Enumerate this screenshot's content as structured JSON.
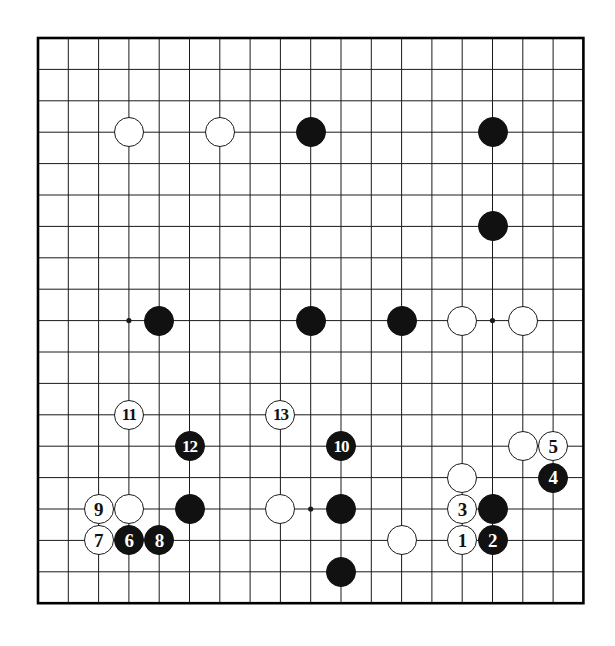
{
  "diagram": {
    "type": "go-board-diagram",
    "board_size": 19,
    "title": "",
    "background_color": "#ffffff",
    "line_color": "#1a1a1a",
    "border_color": "#000000",
    "black_stone_color": "#111111",
    "white_stone_color": "#ffffff",
    "black_label_color": "#ffffff",
    "white_label_color": "#111111"
  },
  "geometry": {
    "origin_x": 38,
    "origin_y": 38,
    "step_x": 30.3,
    "step_y": 31.4,
    "stone_radius": 15,
    "border_width": 2.6,
    "line_width": 1,
    "star_radius": 2.6
  },
  "star_points": [
    {
      "col": 3,
      "row": 3
    },
    {
      "col": 9,
      "row": 3
    },
    {
      "col": 15,
      "row": 3
    },
    {
      "col": 3,
      "row": 9
    },
    {
      "col": 9,
      "row": 9
    },
    {
      "col": 15,
      "row": 9
    },
    {
      "col": 3,
      "row": 15
    },
    {
      "col": 9,
      "row": 15
    },
    {
      "col": 15,
      "row": 15
    }
  ],
  "stones": [
    {
      "color": "white",
      "col": 3,
      "row": 3,
      "label": ""
    },
    {
      "color": "white",
      "col": 6,
      "row": 3,
      "label": ""
    },
    {
      "color": "black",
      "col": 9,
      "row": 3,
      "label": ""
    },
    {
      "color": "black",
      "col": 15,
      "row": 3,
      "label": ""
    },
    {
      "color": "black",
      "col": 15,
      "row": 6,
      "label": ""
    },
    {
      "color": "black",
      "col": 4,
      "row": 9,
      "label": ""
    },
    {
      "color": "black",
      "col": 9,
      "row": 9,
      "label": ""
    },
    {
      "color": "black",
      "col": 12,
      "row": 9,
      "label": ""
    },
    {
      "color": "white",
      "col": 14,
      "row": 9,
      "label": ""
    },
    {
      "color": "white",
      "col": 16,
      "row": 9,
      "label": ""
    },
    {
      "color": "white",
      "col": 3,
      "row": 12,
      "label": "11"
    },
    {
      "color": "white",
      "col": 8,
      "row": 12,
      "label": "13"
    },
    {
      "color": "black",
      "col": 5,
      "row": 13,
      "label": "12"
    },
    {
      "color": "black",
      "col": 10,
      "row": 13,
      "label": "10"
    },
    {
      "color": "white",
      "col": 16,
      "row": 13,
      "label": ""
    },
    {
      "color": "white",
      "col": 17,
      "row": 13,
      "label": "5"
    },
    {
      "color": "black",
      "col": 17,
      "row": 14,
      "label": "4"
    },
    {
      "color": "white",
      "col": 14,
      "row": 14,
      "label": ""
    },
    {
      "color": "white",
      "col": 2,
      "row": 15,
      "label": "9"
    },
    {
      "color": "white",
      "col": 3,
      "row": 15,
      "label": ""
    },
    {
      "color": "black",
      "col": 5,
      "row": 15,
      "label": ""
    },
    {
      "color": "white",
      "col": 8,
      "row": 15,
      "label": ""
    },
    {
      "color": "black",
      "col": 10,
      "row": 15,
      "label": ""
    },
    {
      "color": "white",
      "col": 14,
      "row": 15,
      "label": "3"
    },
    {
      "color": "black",
      "col": 15,
      "row": 15,
      "label": ""
    },
    {
      "color": "white",
      "col": 2,
      "row": 16,
      "label": "7"
    },
    {
      "color": "black",
      "col": 3,
      "row": 16,
      "label": "6"
    },
    {
      "color": "black",
      "col": 4,
      "row": 16,
      "label": "8"
    },
    {
      "color": "white",
      "col": 12,
      "row": 16,
      "label": ""
    },
    {
      "color": "white",
      "col": 14,
      "row": 16,
      "label": "1"
    },
    {
      "color": "black",
      "col": 15,
      "row": 16,
      "label": "2"
    },
    {
      "color": "black",
      "col": 10,
      "row": 17,
      "label": ""
    }
  ],
  "move_sequence": [
    {
      "number": "1",
      "color": "white"
    },
    {
      "number": "2",
      "color": "black"
    },
    {
      "number": "3",
      "color": "white"
    },
    {
      "number": "4",
      "color": "black"
    },
    {
      "number": "5",
      "color": "white"
    },
    {
      "number": "6",
      "color": "black"
    },
    {
      "number": "7",
      "color": "white"
    },
    {
      "number": "8",
      "color": "black"
    },
    {
      "number": "9",
      "color": "white"
    },
    {
      "number": "10",
      "color": "black"
    },
    {
      "number": "11",
      "color": "white"
    },
    {
      "number": "12",
      "color": "black"
    },
    {
      "number": "13",
      "color": "white"
    }
  ]
}
